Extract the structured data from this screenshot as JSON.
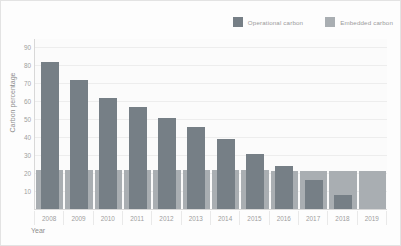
{
  "chart_data": {
    "type": "bar",
    "title": "",
    "xlabel": "Year",
    "ylabel": "Carbon percentage",
    "categories": [
      "2008",
      "2009",
      "2010",
      "2011",
      "2012",
      "2013",
      "2014",
      "2015",
      "2016",
      "2017",
      "2018",
      "2019"
    ],
    "series": [
      {
        "name": "Operational carbon",
        "color": "#767f86",
        "values": [
          82,
          72,
          62,
          57,
          51,
          46,
          39,
          31,
          24,
          16,
          8,
          0
        ]
      },
      {
        "name": "Embedded carbon",
        "color": "#a9aeb2",
        "values": [
          22,
          22,
          22,
          22,
          22,
          22,
          22,
          22,
          21,
          21,
          21,
          21
        ]
      }
    ],
    "yticks": [
      90,
      80,
      70,
      60,
      50,
      40,
      30,
      20,
      10
    ],
    "ylim": [
      0,
      95
    ],
    "grid": true,
    "legend_position": "top-right"
  },
  "legend": {
    "items": [
      {
        "label": "Operational carbon",
        "color": "#767f86"
      },
      {
        "label": "Embedded carbon",
        "color": "#a9aeb2"
      }
    ]
  }
}
